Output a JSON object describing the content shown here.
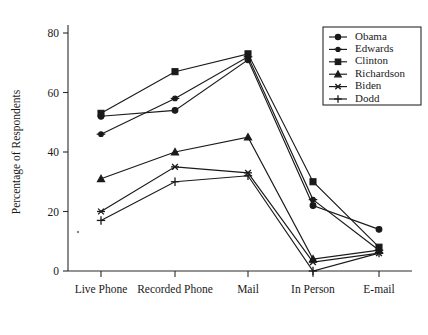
{
  "chart_data": {
    "type": "line",
    "title": "",
    "xlabel": "",
    "ylabel": "Percentage of Respondents",
    "categories": [
      "Live Phone",
      "Recorded Phone",
      "Mail",
      "In Person",
      "E-mail"
    ],
    "ylim": [
      0,
      85
    ],
    "yticks": [
      0,
      20,
      40,
      60,
      80
    ],
    "ytick_labels": [
      "0",
      "20",
      "40",
      "60",
      "80"
    ],
    "grid": false,
    "legend_position": "top-right",
    "series": [
      {
        "name": "Obama",
        "marker": "filled-circle",
        "values": [
          52,
          54,
          71,
          22,
          14
        ]
      },
      {
        "name": "Edwards",
        "marker": "cross-bar",
        "values": [
          46,
          58,
          72,
          24,
          7
        ]
      },
      {
        "name": "Clinton",
        "marker": "filled-square",
        "values": [
          53,
          67,
          73,
          30,
          8
        ]
      },
      {
        "name": "Richardson",
        "marker": "filled-triangle",
        "values": [
          31,
          40,
          45,
          4,
          7
        ]
      },
      {
        "name": "Biden",
        "marker": "star",
        "values": [
          20,
          35,
          33,
          3,
          6
        ]
      },
      {
        "name": "Dodd",
        "marker": "plus",
        "values": [
          17,
          30,
          32,
          0,
          6
        ]
      }
    ]
  },
  "legend": {
    "entries": [
      {
        "label": "Obama"
      },
      {
        "label": "Edwards"
      },
      {
        "label": "Clinton"
      },
      {
        "label": "Richardson"
      },
      {
        "label": "Biden"
      },
      {
        "label": "Dodd"
      }
    ]
  },
  "axes": {
    "y_title": "Percentage of Respondents",
    "y_tick_labels": [
      "80",
      "60",
      "40",
      "20",
      "0"
    ],
    "x_tick_labels": [
      "Live Phone",
      "Recorded Phone",
      "Mail",
      "In Person",
      "E-mail"
    ]
  },
  "colors": {
    "ink": "#1a1a1a",
    "axis": "#2b2b2b",
    "background": "#ffffff"
  }
}
